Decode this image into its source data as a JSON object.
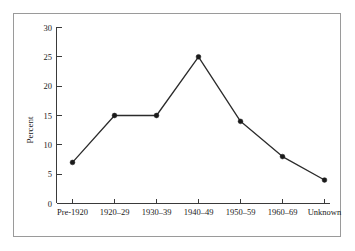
{
  "chart_data": {
    "type": "line",
    "title": "",
    "xlabel": "",
    "ylabel": "Percent",
    "categories": [
      "Pre-1920",
      "1920–29",
      "1930–39",
      "1940–49",
      "1950–59",
      "1960–69",
      "Unknown"
    ],
    "values": [
      7,
      15,
      15,
      25,
      14,
      8,
      4
    ],
    "yticks": [
      "0",
      "5",
      "10",
      "15",
      "20",
      "25",
      "30"
    ],
    "ytick_values": [
      0,
      5,
      10,
      15,
      20,
      25,
      30
    ],
    "ylim": [
      0,
      30
    ],
    "grid": false,
    "legend": false,
    "marker": "filled-circle",
    "line_color": "#2b2b2b",
    "marker_color": "#1a1a1a",
    "frame_color": "#9a9a9a",
    "background": "#ffffff"
  }
}
